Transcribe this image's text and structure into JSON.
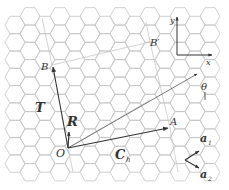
{
  "figure": {
    "colors": {
      "lattice": "#c4c4c4",
      "vectors": "#333333",
      "background": "#ffffff"
    },
    "points": {
      "origin": "O",
      "a": "A",
      "b": "B",
      "b_prime": "B′"
    },
    "vectors": {
      "chiral": {
        "symbol": "C",
        "subscript": "h"
      },
      "translation": {
        "symbol": "T"
      },
      "symmetry": {
        "symbol": "R"
      },
      "unit1": {
        "symbol": "a",
        "subscript": "1"
      },
      "unit2": {
        "symbol": "a",
        "subscript": "2"
      }
    },
    "angle": {
      "symbol": "θ"
    },
    "axes": {
      "x": "x",
      "y": "y"
    }
  }
}
